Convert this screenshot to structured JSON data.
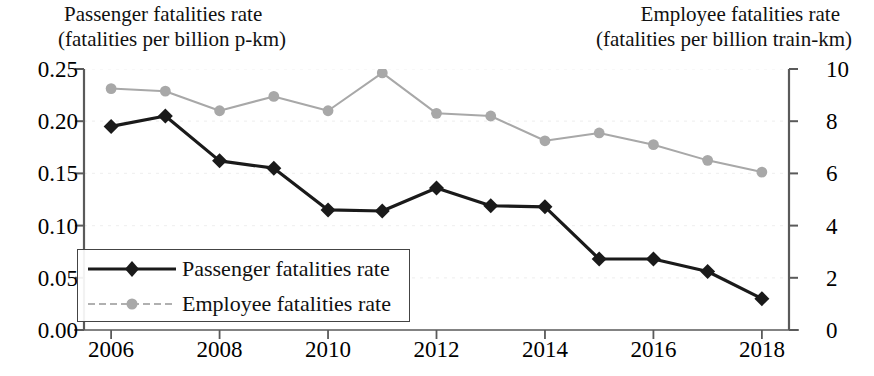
{
  "titles": {
    "left_line1": "Passenger fatalities rate",
    "left_line2": "(fatalities per billion p-km)",
    "right_line1": "Employee fatalities rate",
    "right_line2": "(fatalities per billion train-km)"
  },
  "legend": {
    "items": [
      {
        "label": "Passenger fatalities rate",
        "color": "#1a1a1a",
        "marker": "diamond"
      },
      {
        "label": "Employee fatalities rate",
        "color": "#a8a8a8",
        "marker": "circle"
      }
    ]
  },
  "axes": {
    "left_ticks": [
      "0.00",
      "0.05",
      "0.10",
      "0.15",
      "0.20",
      "0.25"
    ],
    "left_values": [
      0.0,
      0.05,
      0.1,
      0.15,
      0.2,
      0.25
    ],
    "right_ticks": [
      "0",
      "2",
      "4",
      "6",
      "8",
      "10"
    ],
    "right_values": [
      0,
      2,
      4,
      6,
      8,
      10
    ],
    "x_ticks": [
      "2006",
      "2008",
      "2010",
      "2012",
      "2014",
      "2016",
      "2018"
    ],
    "x_tick_values": [
      2006,
      2008,
      2010,
      2012,
      2014,
      2016,
      2018
    ]
  },
  "chart_data": {
    "type": "line",
    "title": "",
    "xlabel": "",
    "ylabel": "Passenger fatalities rate (fatalities per billion p-km)",
    "y2label": "Employee fatalities rate (fatalities per billion train-km)",
    "x": [
      2006,
      2007,
      2008,
      2009,
      2010,
      2011,
      2012,
      2013,
      2014,
      2015,
      2016,
      2017,
      2018
    ],
    "xlim": [
      2005.5,
      2018.5
    ],
    "ylim": [
      0,
      0.25
    ],
    "y2lim": [
      0,
      10
    ],
    "grid": false,
    "legend_position": "lower-left",
    "series": [
      {
        "name": "Passenger fatalities rate",
        "axis": "left",
        "color": "#1a1a1a",
        "marker": "diamond",
        "values": [
          0.195,
          0.205,
          0.162,
          0.155,
          0.115,
          0.114,
          0.136,
          0.119,
          0.118,
          0.068,
          0.068,
          0.056,
          0.03
        ]
      },
      {
        "name": "Employee fatalities rate",
        "axis": "right",
        "color": "#a8a8a8",
        "marker": "circle",
        "values": [
          9.25,
          9.15,
          8.4,
          8.95,
          8.4,
          9.85,
          8.3,
          8.2,
          7.25,
          7.55,
          7.1,
          6.5,
          6.05
        ]
      }
    ]
  }
}
